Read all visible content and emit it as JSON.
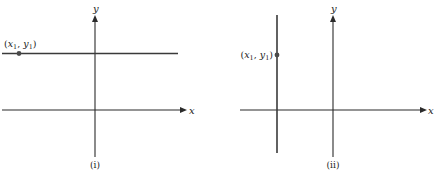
{
  "panels": [
    {
      "caption": "(i)",
      "x_axis_label": "x",
      "y_axis_label": "y",
      "line_type": "horizontal",
      "point_label": {
        "open": "(",
        "x": "x",
        "x_sub": "1",
        "sep": ", ",
        "y": "y",
        "y_sub": "1",
        "close": ")"
      }
    },
    {
      "caption": "(ii)",
      "x_axis_label": "x",
      "y_axis_label": "y",
      "line_type": "vertical",
      "point_label": {
        "open": "(",
        "x": "x",
        "x_sub": "1",
        "sep": ", ",
        "y": "y",
        "y_sub": "1",
        "close": ")"
      }
    }
  ],
  "colors": {
    "ink": "#2b2b2b",
    "point": "#4a4a4a"
  }
}
